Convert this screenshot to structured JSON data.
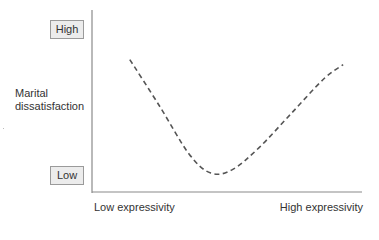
{
  "chart_data": {
    "type": "line",
    "title": "",
    "xlabel": "Expressivity",
    "ylabel": "Marital dissatisfaction",
    "x_tick_labels": [
      "Low expressivity",
      "High expressivity"
    ],
    "y_tick_labels": [
      "Low",
      "High"
    ],
    "series": [
      {
        "name": "Marital dissatisfaction vs. expressivity",
        "style": "dashed",
        "color": "#555555",
        "x": [
          0.14,
          0.25,
          0.36,
          0.44,
          0.52,
          0.62,
          0.74,
          0.86,
          0.93
        ],
        "y": [
          0.77,
          0.5,
          0.22,
          0.11,
          0.13,
          0.26,
          0.46,
          0.66,
          0.74
        ]
      }
    ],
    "xlim": [
      0,
      1
    ],
    "ylim": [
      0,
      1
    ],
    "grid": false,
    "legend": "none",
    "shape": "U-shaped curve: dissatisfaction is high at low expressivity, lowest at moderate expressivity, and rises again at high expressivity"
  },
  "y_axis": {
    "title_line1": "Marital",
    "title_line2": "dissatisfaction",
    "high_label": "High",
    "low_label": "Low"
  },
  "x_axis": {
    "low_label": "Low expressivity",
    "high_label": "High expressivity"
  },
  "colors": {
    "axis": "#8a8a8a",
    "curve": "#555555",
    "box_fill": "#ececec",
    "box_border": "#9a9a9a",
    "text": "#333333"
  }
}
